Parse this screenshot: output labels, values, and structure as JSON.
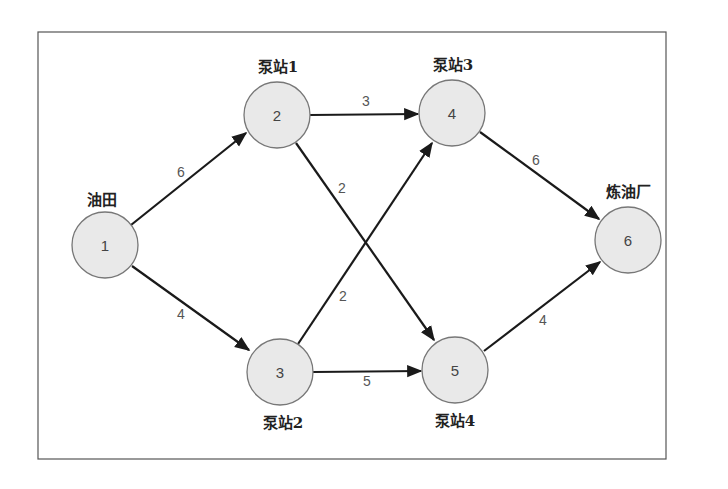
{
  "diagram": {
    "type": "directed-network",
    "colors": {
      "node_fill": "#e9e9e9",
      "node_stroke": "#777777",
      "edge": "#1a1a1a",
      "frame": "#555555"
    },
    "nodes": [
      {
        "id": "1",
        "label": "油田"
      },
      {
        "id": "2",
        "label": "泵站1"
      },
      {
        "id": "3",
        "label": "泵站2"
      },
      {
        "id": "4",
        "label": "泵站3"
      },
      {
        "id": "5",
        "label": "泵站4"
      },
      {
        "id": "6",
        "label": "炼油厂"
      }
    ],
    "edges": [
      {
        "from": "1",
        "to": "2",
        "weight": "6"
      },
      {
        "from": "1",
        "to": "3",
        "weight": "4"
      },
      {
        "from": "2",
        "to": "4",
        "weight": "3"
      },
      {
        "from": "2",
        "to": "5",
        "weight": "2"
      },
      {
        "from": "3",
        "to": "4",
        "weight": "2"
      },
      {
        "from": "3",
        "to": "5",
        "weight": "5"
      },
      {
        "from": "4",
        "to": "6",
        "weight": "6"
      },
      {
        "from": "5",
        "to": "6",
        "weight": "4"
      }
    ]
  }
}
